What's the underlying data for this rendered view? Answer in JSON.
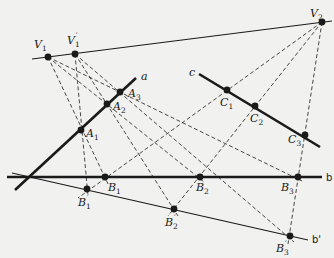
{
  "diagram": {
    "type": "projective-geometry-construction",
    "colors": {
      "ink": "#1a1a1a",
      "background": "#f1f1ef"
    },
    "lines": {
      "a": {
        "label": "a",
        "from": [
          15,
          190
        ],
        "to": [
          136,
          78
        ],
        "weight": "bold"
      },
      "b": {
        "label": "b",
        "from": [
          7,
          177
        ],
        "to": [
          322,
          177
        ],
        "weight": "bold"
      },
      "c": {
        "label": "c",
        "from": [
          199,
          74
        ],
        "to": [
          320,
          147
        ],
        "weight": "bold"
      },
      "b_prime": {
        "label": "b'",
        "from": [
          12,
          173
        ],
        "to": [
          308,
          240
        ],
        "weight": "thin"
      },
      "vanishing": {
        "label": "",
        "from": [
          32,
          59
        ],
        "to": [
          332,
          21
        ],
        "weight": "thin"
      }
    },
    "points": [
      {
        "id": "V1",
        "base": "V",
        "sub": "1",
        "prime": false,
        "pos": [
          48,
          57
        ],
        "label_pos": [
          34,
          48
        ]
      },
      {
        "id": "V1p",
        "base": "V",
        "sub": "1",
        "prime": true,
        "pos": [
          75,
          54
        ],
        "label_pos": [
          67,
          44
        ]
      },
      {
        "id": "V2",
        "base": "V",
        "sub": "2",
        "prime": false,
        "pos": [
          322,
          22
        ],
        "label_pos": [
          310,
          17
        ]
      },
      {
        "id": "A1",
        "base": "A",
        "sub": "1",
        "prime": false,
        "pos": [
          81,
          130
        ],
        "label_pos": [
          86,
          137
        ]
      },
      {
        "id": "A2",
        "base": "A",
        "sub": "2",
        "prime": false,
        "pos": [
          107,
          104
        ],
        "label_pos": [
          113,
          110
        ]
      },
      {
        "id": "A3",
        "base": "A",
        "sub": "3",
        "prime": false,
        "pos": [
          120,
          92
        ],
        "label_pos": [
          128,
          97
        ]
      },
      {
        "id": "C1",
        "base": "C",
        "sub": "1",
        "prime": false,
        "pos": [
          227,
          90
        ],
        "label_pos": [
          220,
          106
        ]
      },
      {
        "id": "C2",
        "base": "C",
        "sub": "2",
        "prime": false,
        "pos": [
          255,
          106
        ],
        "label_pos": [
          250,
          122
        ]
      },
      {
        "id": "C3",
        "base": "C",
        "sub": "3",
        "prime": false,
        "pos": [
          305,
          135
        ],
        "label_pos": [
          288,
          143
        ]
      },
      {
        "id": "B1",
        "base": "B",
        "sub": "1",
        "prime": false,
        "pos": [
          105,
          177
        ],
        "label_pos": [
          108,
          191
        ]
      },
      {
        "id": "B2",
        "base": "B",
        "sub": "2",
        "prime": false,
        "pos": [
          200,
          177
        ],
        "label_pos": [
          196,
          191
        ]
      },
      {
        "id": "B3",
        "base": "B",
        "sub": "3",
        "prime": false,
        "pos": [
          298,
          177
        ],
        "label_pos": [
          281,
          191
        ]
      },
      {
        "id": "B1p",
        "base": "B",
        "sub": "1",
        "prime": true,
        "pos": [
          87,
          189
        ],
        "label_pos": [
          78,
          206
        ]
      },
      {
        "id": "B2p",
        "base": "B",
        "sub": "2",
        "prime": true,
        "pos": [
          174,
          209
        ],
        "label_pos": [
          165,
          226
        ]
      },
      {
        "id": "B3p",
        "base": "B",
        "sub": "3",
        "prime": true,
        "pos": [
          290,
          236
        ],
        "label_pos": [
          276,
          252
        ]
      }
    ],
    "dashed_lines": [
      {
        "from": [
          48,
          57
        ],
        "to": [
          108,
          184
        ]
      },
      {
        "from": [
          48,
          57
        ],
        "to": [
          204,
          182
        ]
      },
      {
        "from": [
          48,
          57
        ],
        "to": [
          302,
          181
        ]
      },
      {
        "from": [
          75,
          54
        ],
        "to": [
          88,
          196
        ]
      },
      {
        "from": [
          75,
          54
        ],
        "to": [
          178,
          216
        ]
      },
      {
        "from": [
          75,
          54
        ],
        "to": [
          294,
          242
        ]
      },
      {
        "from": [
          322,
          22
        ],
        "to": [
          78,
          198
        ]
      },
      {
        "from": [
          322,
          22
        ],
        "to": [
          168,
          216
        ]
      },
      {
        "from": [
          322,
          22
        ],
        "to": [
          288,
          244
        ]
      }
    ],
    "line_labels": [
      {
        "text": "a",
        "pos": [
          141,
          80
        ]
      },
      {
        "text": "c",
        "pos": [
          189,
          76
        ]
      },
      {
        "text": "b",
        "pos": [
          326,
          181
        ]
      },
      {
        "text": "b'",
        "pos": [
          312,
          243
        ]
      }
    ]
  }
}
